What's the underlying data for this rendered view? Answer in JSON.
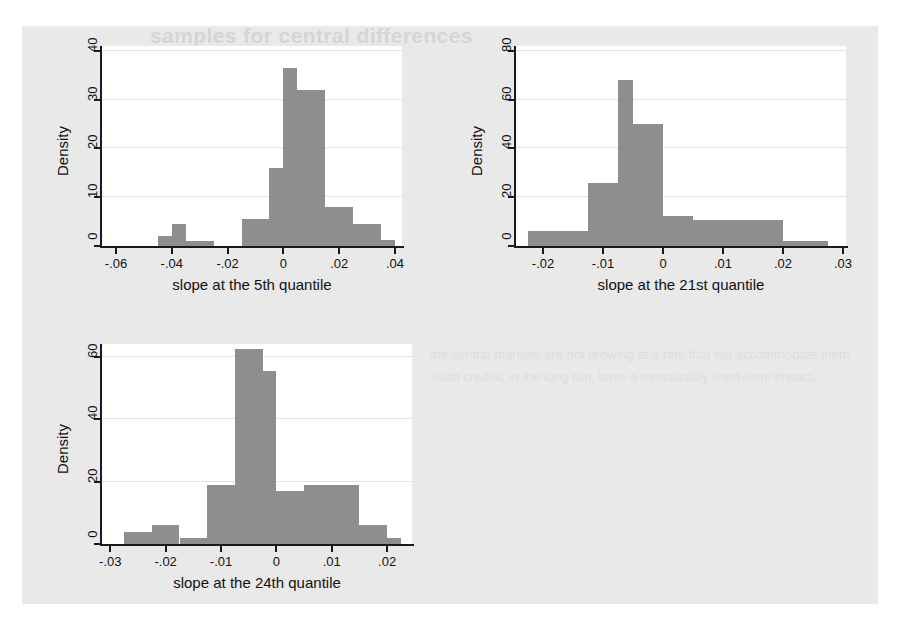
{
  "page": {
    "background_color": "#ffffff",
    "figure_background_color": "#e9e9e9",
    "bar_color": "#8e8e8e",
    "axis_color": "#1a1a1a",
    "gridline_color": "#e3e3e3",
    "bleed_through_title": "samples for central differences",
    "bleed_through_body": "the central markets are not growing at a rate that will accommodate them. Such credits, in the long run, have a measurably short-term impact."
  },
  "chart_data": [
    {
      "id": "chart-5th-quantile",
      "type": "bar",
      "title": "",
      "xlabel": "slope at the 5th quantile",
      "ylabel": "Density",
      "xlim": [
        -0.065,
        0.0425
      ],
      "ylim": [
        0,
        41
      ],
      "grid": true,
      "legend": "none",
      "xticks": [
        -0.06,
        -0.04,
        -0.02,
        0,
        0.02,
        0.04
      ],
      "xticklabels": [
        "-.06",
        "-.04",
        "-.02",
        "0",
        ".02",
        ".04"
      ],
      "yticks": [
        0,
        10,
        20,
        30,
        40
      ],
      "yticklabels": [
        "0",
        "10",
        "20",
        "30",
        "40"
      ],
      "bin_width": 0.005,
      "bin_starts": [
        -0.05,
        -0.045,
        -0.04,
        -0.035,
        -0.03,
        -0.025,
        -0.02,
        -0.015,
        -0.01,
        -0.005,
        0.0,
        0.005,
        0.01,
        0.015,
        0.02,
        0.025,
        0.03,
        0.035
      ],
      "values": [
        0,
        2.0,
        4.5,
        1.0,
        1.0,
        0,
        0,
        5.5,
        5.5,
        16.0,
        36.5,
        32.0,
        32.0,
        8.0,
        8.0,
        4.5,
        4.5,
        1.3
      ]
    },
    {
      "id": "chart-21st-quantile",
      "type": "bar",
      "title": "",
      "xlabel": "slope at the 21st quantile",
      "ylabel": "Density",
      "xlim": [
        -0.0245,
        0.0305
      ],
      "ylim": [
        0,
        82
      ],
      "grid": true,
      "legend": "none",
      "xticks": [
        -0.02,
        -0.01,
        0,
        0.01,
        0.02,
        0.03
      ],
      "xticklabels": [
        "-.02",
        "-.01",
        "0",
        ".01",
        ".02",
        ".03"
      ],
      "yticks": [
        0,
        20,
        40,
        60,
        80
      ],
      "yticklabels": [
        "0",
        "20",
        "40",
        "60",
        "80"
      ],
      "bin_width": 0.0025,
      "bin_starts": [
        -0.0225,
        -0.02,
        -0.0175,
        -0.015,
        -0.0125,
        -0.01,
        -0.0075,
        -0.005,
        -0.0025,
        0.0,
        0.0025,
        0.005,
        0.0075,
        0.01,
        0.0125,
        0.015,
        0.0175,
        0.02,
        0.0225,
        0.025
      ],
      "values": [
        6.0,
        6.0,
        6.0,
        6.0,
        26.0,
        26.0,
        68.0,
        50.0,
        50.0,
        12.5,
        12.5,
        10.5,
        10.5,
        10.5,
        10.5,
        10.5,
        10.5,
        2.0,
        2.0,
        2.0
      ]
    },
    {
      "id": "chart-24th-quantile",
      "type": "bar",
      "title": "",
      "xlabel": "slope at the 24th quantile",
      "ylabel": "Density",
      "xlim": [
        -0.0315,
        0.0245
      ],
      "ylim": [
        0,
        64
      ],
      "grid": true,
      "legend": "none",
      "xticks": [
        -0.03,
        -0.02,
        -0.01,
        0,
        0.01,
        0.02
      ],
      "xticklabels": [
        "-.03",
        "-.02",
        "-.01",
        "0",
        ".01",
        ".02"
      ],
      "yticks": [
        0,
        20,
        40,
        60
      ],
      "yticklabels": [
        "0",
        "20",
        "40",
        "60"
      ],
      "bin_width": 0.0025,
      "bin_starts": [
        -0.0275,
        -0.025,
        -0.0225,
        -0.02,
        -0.0175,
        -0.015,
        -0.0125,
        -0.01,
        -0.0075,
        -0.005,
        -0.0025,
        0.0,
        0.0025,
        0.005,
        0.0075,
        0.01,
        0.0125,
        0.015,
        0.0175,
        0.02
      ],
      "values": [
        4.0,
        4.0,
        6.0,
        6.0,
        2.0,
        2.0,
        19.0,
        19.0,
        62.5,
        62.5,
        55.5,
        17.0,
        17.0,
        19.0,
        19.0,
        19.0,
        19.0,
        6.0,
        6.0,
        2.0
      ]
    }
  ]
}
